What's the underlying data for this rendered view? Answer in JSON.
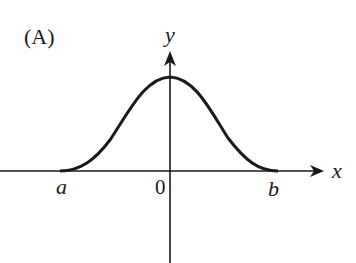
{
  "figure": {
    "panel_label": "(A)",
    "x_axis_label": "x",
    "y_axis_label": "y",
    "origin_label": "0",
    "left_point_label": "a",
    "right_point_label": "b",
    "curve_description": "bell-shaped curve rising from a, peaking on the y-axis, falling to b",
    "colors": {
      "ink": "#1a1a1a",
      "background": "#ffffff"
    }
  }
}
